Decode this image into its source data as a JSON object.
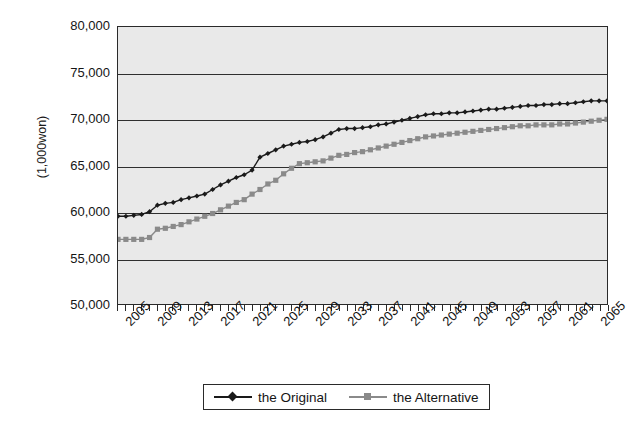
{
  "chart_data": {
    "type": "line",
    "title": "",
    "xlabel": "",
    "ylabel": "(1,000won)",
    "ylim": [
      50000,
      80000
    ],
    "ytick_step": 5000,
    "ytick_labels": [
      "80,000",
      "75,000",
      "70,000",
      "65,000",
      "60,000",
      "55,000",
      "50,000"
    ],
    "ytick_values": [
      80000,
      75000,
      70000,
      65000,
      60000,
      55000,
      50000
    ],
    "grid": true,
    "grid_axis": "y",
    "legend_position": "bottom-center",
    "xlim": [
      2005,
      2067
    ],
    "xtick_labels": [
      "2005",
      "2009",
      "2013",
      "2017",
      "2021",
      "2025",
      "2029",
      "2033",
      "2037",
      "2041",
      "2045",
      "2049",
      "2053",
      "2057",
      "2061",
      "2065"
    ],
    "xtick_values": [
      2005,
      2009,
      2013,
      2017,
      2021,
      2025,
      2029,
      2033,
      2037,
      2041,
      2045,
      2049,
      2053,
      2057,
      2061,
      2065
    ],
    "xtick_minor_step": 1,
    "x": [
      2005,
      2006,
      2007,
      2008,
      2009,
      2010,
      2011,
      2012,
      2013,
      2014,
      2015,
      2016,
      2017,
      2018,
      2019,
      2020,
      2021,
      2022,
      2023,
      2024,
      2025,
      2026,
      2027,
      2028,
      2029,
      2030,
      2031,
      2032,
      2033,
      2034,
      2035,
      2036,
      2037,
      2038,
      2039,
      2040,
      2041,
      2042,
      2043,
      2044,
      2045,
      2046,
      2047,
      2048,
      2049,
      2050,
      2051,
      2052,
      2053,
      2054,
      2055,
      2056,
      2057,
      2058,
      2059,
      2060,
      2061,
      2062,
      2063,
      2064,
      2065,
      2066,
      2067
    ],
    "series": [
      {
        "name": "the Original",
        "color": "#1a1a1a",
        "marker": "diamond",
        "values": [
          59500,
          59500,
          59600,
          59700,
          60000,
          60700,
          60900,
          61000,
          61300,
          61500,
          61700,
          61900,
          62400,
          62900,
          63300,
          63700,
          64000,
          64500,
          65900,
          66300,
          66700,
          67100,
          67300,
          67500,
          67600,
          67800,
          68100,
          68500,
          68900,
          69000,
          69000,
          69100,
          69200,
          69400,
          69500,
          69700,
          69900,
          70100,
          70300,
          70500,
          70600,
          70600,
          70700,
          70700,
          70800,
          70900,
          71000,
          71100,
          71100,
          71200,
          71300,
          71400,
          71500,
          71500,
          71600,
          71600,
          71700,
          71700,
          71800,
          71900,
          72000,
          72000,
          72000
        ]
      },
      {
        "name": "the Alternative",
        "color": "#8a8a8a",
        "marker": "square",
        "values": [
          57000,
          57000,
          57000,
          57000,
          57200,
          58100,
          58200,
          58400,
          58600,
          58900,
          59200,
          59500,
          59800,
          60200,
          60600,
          61000,
          61300,
          61900,
          62400,
          63000,
          63400,
          64100,
          64700,
          65200,
          65300,
          65400,
          65500,
          65800,
          66100,
          66200,
          66400,
          66500,
          66700,
          66900,
          67100,
          67300,
          67500,
          67700,
          67900,
          68100,
          68200,
          68300,
          68400,
          68500,
          68600,
          68700,
          68800,
          68900,
          69000,
          69100,
          69200,
          69300,
          69300,
          69400,
          69400,
          69400,
          69500,
          69500,
          69600,
          69700,
          69800,
          69900,
          70000
        ]
      }
    ]
  },
  "legend": {
    "entries": [
      {
        "label": "the Original",
        "color": "#1a1a1a",
        "marker": "diamond"
      },
      {
        "label": "the Alternative",
        "color": "#8a8a8a",
        "marker": "square"
      }
    ]
  }
}
